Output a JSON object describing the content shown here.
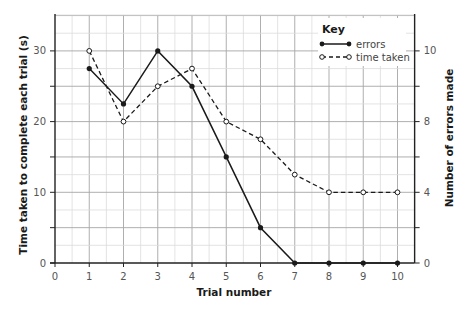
{
  "chart_data": {
    "type": "line",
    "title": "",
    "xlabel": "Trial number",
    "ylabel": "Time taken to complete each trial (s)",
    "y2label": "Number of errors made",
    "x": [
      1,
      2,
      3,
      4,
      5,
      6,
      7,
      8,
      9,
      10
    ],
    "xlim": [
      0,
      10.5
    ],
    "ylim": [
      0,
      35
    ],
    "x_ticks": [
      0,
      1,
      2,
      3,
      4,
      5,
      6,
      7,
      8,
      9,
      10
    ],
    "y_ticks": [
      0,
      10,
      20,
      30
    ],
    "y_minor_step": 2.5,
    "x_minor_step": 0.5,
    "y2_ticks": [
      {
        "at_left_value": 0,
        "label": "0"
      },
      {
        "at_left_value": 5,
        "label": ""
      },
      {
        "at_left_value": 10,
        "label": "4"
      },
      {
        "at_left_value": 15,
        "label": ""
      },
      {
        "at_left_value": 20,
        "label": "8"
      },
      {
        "at_left_value": 25,
        "label": ""
      },
      {
        "at_left_value": 30,
        "label": "10"
      }
    ],
    "grid": true,
    "legend_position": "upper right",
    "series": [
      {
        "name": "errors",
        "style": "solid",
        "marker": "filled-circle",
        "plotted_on_left_scale": [
          27.5,
          22.5,
          30,
          25,
          15,
          5,
          0,
          0,
          0,
          0
        ]
      },
      {
        "name": "time taken",
        "style": "dashed",
        "marker": "open-circle",
        "values": [
          30,
          20,
          25,
          27.5,
          20,
          17.5,
          12.5,
          10,
          10,
          10
        ]
      }
    ]
  },
  "legend": {
    "title": "Key",
    "items": [
      {
        "label": "errors"
      },
      {
        "label": "time taken"
      }
    ]
  },
  "colors": {
    "line": "#1a1a1a",
    "grid_major": "#a6a6a6",
    "grid_minor": "#dcdcdc",
    "axis": "#222222"
  }
}
